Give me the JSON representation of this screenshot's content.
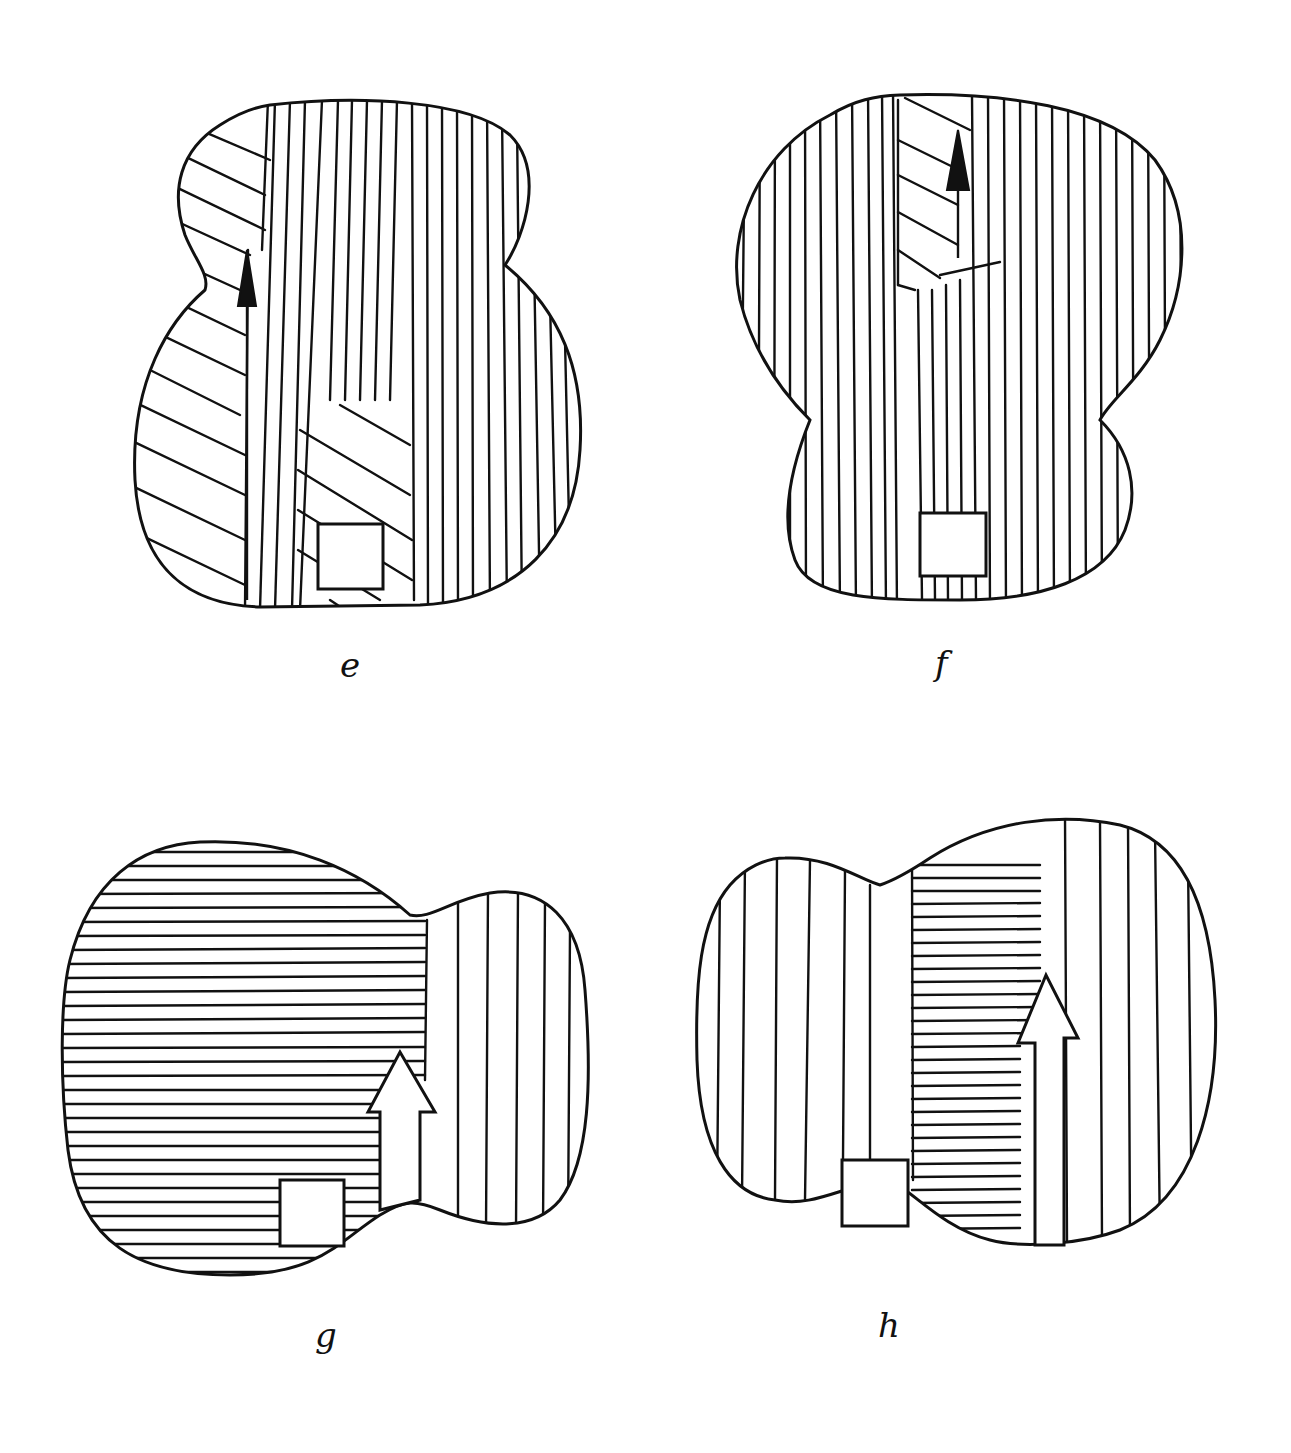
{
  "figures": [
    {
      "id": "e",
      "label": "e",
      "orientation": "upright",
      "grain": "mostly-vertical with diagonal left and lower-center inserts",
      "arrow": "solid-black",
      "marker": "square-patch"
    },
    {
      "id": "f",
      "label": "f",
      "orientation": "inverted",
      "grain": "vertical with diagonal upper-center insert",
      "arrow": "solid-black",
      "marker": "square-patch"
    },
    {
      "id": "g",
      "label": "g",
      "orientation": "rotated-left",
      "grain": "horizontal main, vertical small lobe",
      "arrow": "hollow-block",
      "marker": "square-patch"
    },
    {
      "id": "h",
      "label": "h",
      "orientation": "rotated-right",
      "grain": "vertical small lobe, horizontal center strip, vertical large lobe",
      "arrow": "hollow-block",
      "marker": "square-patch"
    }
  ],
  "colors": {
    "ink": "#111111",
    "paper": "#ffffff"
  }
}
